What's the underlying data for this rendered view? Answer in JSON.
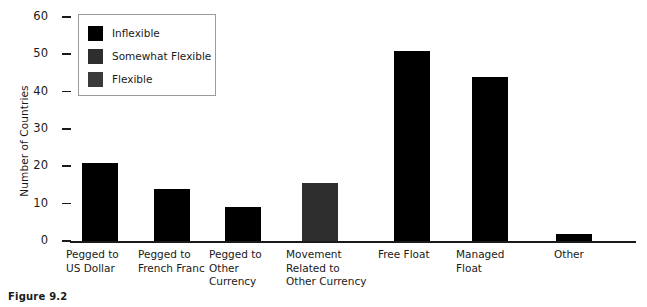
{
  "caption": "Figure 9.2",
  "legend": {
    "entries": [
      {
        "label": "Inflexible",
        "color": "#000000"
      },
      {
        "label": "Somewhat Flexible",
        "color": "#2e2e2e"
      },
      {
        "label": "Flexible",
        "color": "#3a3a3a"
      }
    ]
  },
  "axes": {
    "ylabel": "Number of Countries",
    "yticks": [
      "0",
      "10",
      "20",
      "30",
      "40",
      "50",
      "60"
    ]
  },
  "chart_data": {
    "type": "bar",
    "title": "",
    "subtitle": "",
    "xlabel": "",
    "ylabel": "Number of Countries",
    "ylim": [
      0,
      60
    ],
    "ytick_values": [
      0,
      10,
      20,
      30,
      40,
      50,
      60
    ],
    "grid": false,
    "legend_position": "upper-left-inside",
    "categories": [
      "Pegged to\nUS Dollar",
      "Pegged to\nFrench Franc",
      "Pegged to\nOther\nCurrency",
      "Movement\nRelated to\nOther Currency",
      "Free Float",
      "Managed\nFloat",
      "Other"
    ],
    "values": [
      21,
      14,
      9,
      15.5,
      51,
      44,
      2
    ],
    "series": [
      {
        "name": "Number of Countries",
        "values": [
          21,
          14,
          9,
          15.5,
          51,
          44,
          2
        ],
        "point_categories": [
          "Inflexible",
          "Inflexible",
          "Inflexible",
          "Somewhat Flexible",
          "Inflexible",
          "Inflexible",
          "Inflexible"
        ],
        "point_colors": [
          "#000000",
          "#000000",
          "#000000",
          "#2e2e2e",
          "#000000",
          "#000000",
          "#000000"
        ]
      }
    ],
    "legend_entries": [
      "Inflexible",
      "Somewhat Flexible",
      "Flexible"
    ]
  }
}
